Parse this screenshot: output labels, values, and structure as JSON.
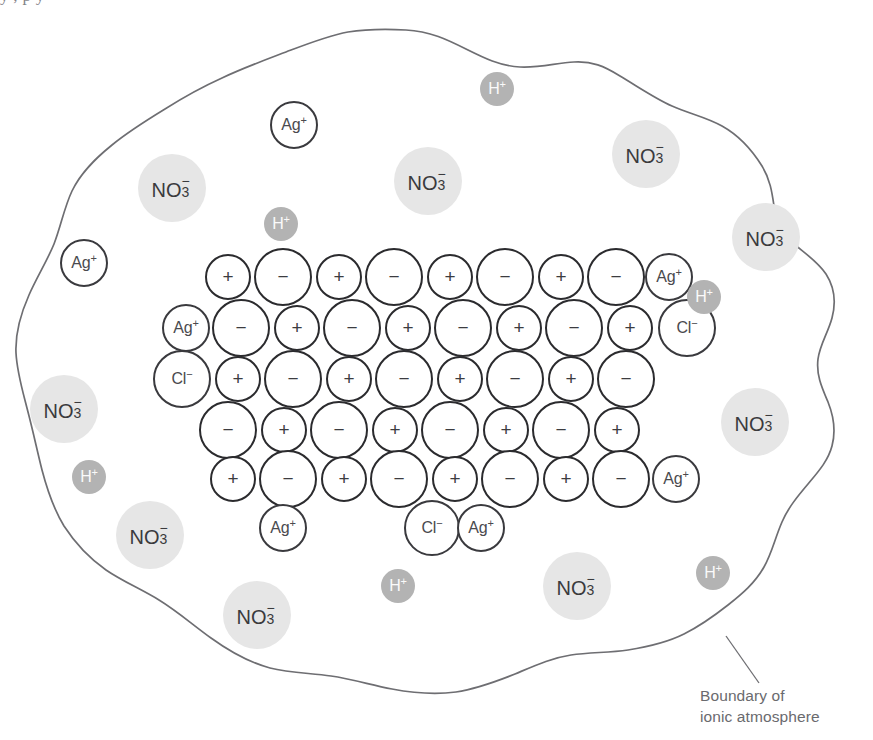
{
  "figure": {
    "top_cut_text": "y  ,                                                                                                      p  y",
    "boundary_label": {
      "line1": "Boundary of",
      "line2": "ionic atmosphere"
    },
    "colors": {
      "background": "#ffffff",
      "boundary_line": "#6e6e72",
      "lattice_outline": "#2b2b2e",
      "free_ion_outline": "#3a3a3e",
      "nitrate_fill": "#e6e6e6",
      "nitrate_text": "#3a3a3d",
      "proton_fill": "#b3b3b3",
      "proton_text": "#fafafa",
      "caption_text": "#6a6a6e"
    }
  },
  "legend": {
    "cation_symbol": "+",
    "anion_symbol": "−",
    "silver_label": "Ag",
    "silver_charge": "+",
    "chloride_label": "Cl",
    "chloride_charge": "−",
    "nitrate_label": "NO",
    "nitrate_subscript": "3",
    "nitrate_charge": "−",
    "proton_label": "H",
    "proton_charge": "+"
  },
  "lattice": {
    "description": "AgCl crystal lattice: small circles are Ag+ cations (+), large circles are Cl- anions (−)",
    "rows": [
      {
        "row": 1,
        "y": 277,
        "x_start": 228,
        "ions": [
          {
            "type": "cation",
            "symbol": "+",
            "x": 228,
            "r": 23
          },
          {
            "type": "anion",
            "symbol": "−",
            "x": 283,
            "r": 29
          },
          {
            "type": "cation",
            "symbol": "+",
            "x": 339,
            "r": 23
          },
          {
            "type": "anion",
            "symbol": "−",
            "x": 394,
            "r": 29
          },
          {
            "type": "cation",
            "symbol": "+",
            "x": 450,
            "r": 23
          },
          {
            "type": "anion",
            "symbol": "−",
            "x": 505,
            "r": 29
          },
          {
            "type": "cation",
            "symbol": "+",
            "x": 561,
            "r": 23
          },
          {
            "type": "anion",
            "symbol": "−",
            "x": 616,
            "r": 29
          },
          {
            "type": "cation",
            "symbol": "Ag+",
            "x": 669,
            "r": 24,
            "labelled": true
          }
        ]
      },
      {
        "row": 2,
        "y": 328,
        "x_start": 186,
        "ions": [
          {
            "type": "cation",
            "symbol": "Ag+",
            "x": 186,
            "r": 24,
            "labelled": true
          },
          {
            "type": "anion",
            "symbol": "−",
            "x": 241,
            "r": 29
          },
          {
            "type": "cation",
            "symbol": "+",
            "x": 297,
            "r": 23
          },
          {
            "type": "anion",
            "symbol": "−",
            "x": 352,
            "r": 29
          },
          {
            "type": "cation",
            "symbol": "+",
            "x": 408,
            "r": 23
          },
          {
            "type": "anion",
            "symbol": "−",
            "x": 463,
            "r": 29
          },
          {
            "type": "cation",
            "symbol": "+",
            "x": 519,
            "r": 23
          },
          {
            "type": "anion",
            "symbol": "−",
            "x": 574,
            "r": 29
          },
          {
            "type": "cation",
            "symbol": "+",
            "x": 630,
            "r": 23
          },
          {
            "type": "anion",
            "symbol": "Cl-",
            "x": 687,
            "r": 29,
            "labelled": true
          }
        ]
      },
      {
        "row": 3,
        "y": 379,
        "x_start": 182,
        "ions": [
          {
            "type": "anion",
            "symbol": "Cl-",
            "x": 182,
            "r": 29,
            "labelled": true
          },
          {
            "type": "cation",
            "symbol": "+",
            "x": 238,
            "r": 23
          },
          {
            "type": "anion",
            "symbol": "−",
            "x": 293,
            "r": 29
          },
          {
            "type": "cation",
            "symbol": "+",
            "x": 349,
            "r": 23
          },
          {
            "type": "anion",
            "symbol": "−",
            "x": 404,
            "r": 29
          },
          {
            "type": "cation",
            "symbol": "+",
            "x": 460,
            "r": 23
          },
          {
            "type": "anion",
            "symbol": "−",
            "x": 515,
            "r": 29
          },
          {
            "type": "cation",
            "symbol": "+",
            "x": 571,
            "r": 23
          },
          {
            "type": "anion",
            "symbol": "−",
            "x": 626,
            "r": 29
          }
        ]
      },
      {
        "row": 4,
        "y": 430,
        "x_start": 228,
        "ions": [
          {
            "type": "anion",
            "symbol": "−",
            "x": 228,
            "r": 29
          },
          {
            "type": "cation",
            "symbol": "+",
            "x": 284,
            "r": 23
          },
          {
            "type": "anion",
            "symbol": "−",
            "x": 339,
            "r": 29
          },
          {
            "type": "cation",
            "symbol": "+",
            "x": 395,
            "r": 23
          },
          {
            "type": "anion",
            "symbol": "−",
            "x": 450,
            "r": 29
          },
          {
            "type": "cation",
            "symbol": "+",
            "x": 506,
            "r": 23
          },
          {
            "type": "anion",
            "symbol": "−",
            "x": 561,
            "r": 29
          },
          {
            "type": "cation",
            "symbol": "+",
            "x": 617,
            "r": 23
          }
        ]
      },
      {
        "row": 5,
        "y": 479,
        "x_start": 233,
        "ions": [
          {
            "type": "cation",
            "symbol": "+",
            "x": 233,
            "r": 23
          },
          {
            "type": "anion",
            "symbol": "−",
            "x": 288,
            "r": 29
          },
          {
            "type": "cation",
            "symbol": "+",
            "x": 344,
            "r": 23
          },
          {
            "type": "anion",
            "symbol": "−",
            "x": 399,
            "r": 29
          },
          {
            "type": "cation",
            "symbol": "+",
            "x": 455,
            "r": 23
          },
          {
            "type": "anion",
            "symbol": "−",
            "x": 510,
            "r": 29
          },
          {
            "type": "cation",
            "symbol": "+",
            "x": 566,
            "r": 23
          },
          {
            "type": "anion",
            "symbol": "−",
            "x": 621,
            "r": 29
          },
          {
            "type": "cation",
            "symbol": "Ag+",
            "x": 676,
            "r": 24,
            "labelled": true
          }
        ]
      },
      {
        "row": 6,
        "y": 528,
        "x_start": 283,
        "ions": [
          {
            "type": "cation",
            "symbol": "Ag+",
            "x": 283,
            "r": 24,
            "labelled": true
          },
          {
            "type": "anion",
            "symbol": "Cl-",
            "x": 432,
            "r": 28,
            "labelled": true
          },
          {
            "type": "cation",
            "symbol": "Ag+",
            "x": 481,
            "r": 24,
            "labelled": true
          }
        ]
      }
    ]
  },
  "free_ions": [
    {
      "species": "Ag+",
      "x": 84,
      "y": 263,
      "r": 24
    },
    {
      "species": "Ag+",
      "x": 294,
      "y": 125,
      "r": 24
    }
  ],
  "nitrate_ions": [
    {
      "x": 172,
      "y": 188,
      "r": 34
    },
    {
      "x": 428,
      "y": 181,
      "r": 34
    },
    {
      "x": 646,
      "y": 154,
      "r": 34
    },
    {
      "x": 766,
      "y": 237,
      "r": 34
    },
    {
      "x": 64,
      "y": 409,
      "r": 34
    },
    {
      "x": 755,
      "y": 422,
      "r": 34
    },
    {
      "x": 150,
      "y": 535,
      "r": 34
    },
    {
      "x": 577,
      "y": 586,
      "r": 34
    },
    {
      "x": 257,
      "y": 615,
      "r": 34
    }
  ],
  "proton_ions": [
    {
      "x": 497,
      "y": 89,
      "r": 17
    },
    {
      "x": 281,
      "y": 224,
      "r": 17
    },
    {
      "x": 704,
      "y": 297,
      "r": 17
    },
    {
      "x": 89,
      "y": 477,
      "r": 17
    },
    {
      "x": 398,
      "y": 586,
      "r": 17
    },
    {
      "x": 713,
      "y": 573,
      "r": 17
    }
  ],
  "boundary": {
    "leader_line": {
      "x1": 726,
      "y1": 636,
      "x2": 759,
      "y2": 683
    }
  },
  "chart_data": {
    "type": "diagram",
    "species_counts": {
      "lattice_cations": 40,
      "lattice_anions": 38,
      "free_silver_ions": 2,
      "nitrate_ions": 9,
      "hydrogen_ions": 6
    }
  }
}
